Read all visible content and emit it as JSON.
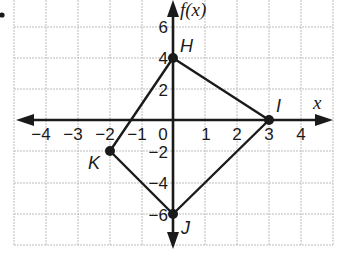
{
  "diagram": {
    "type": "coordinate-plane",
    "title": "",
    "x_axis_label": "x",
    "y_axis_label": "f(x)",
    "x_range": [
      -5,
      5
    ],
    "y_range": [
      -8,
      8
    ],
    "grid_x_step": 1,
    "grid_y_step": 2,
    "x_tick_labels": [
      "−4",
      "−3",
      "−2",
      "−1",
      "0",
      "1",
      "2",
      "3",
      "4"
    ],
    "y_tick_labels": [
      "6",
      "4",
      "2",
      "−2",
      "−4",
      "−6"
    ],
    "points": [
      {
        "label": "H",
        "x": 0,
        "y": 4
      },
      {
        "label": "I",
        "x": 3,
        "y": 0
      },
      {
        "label": "J",
        "x": 0,
        "y": -6
      },
      {
        "label": "K",
        "x": -2,
        "y": -2
      }
    ],
    "polygon": [
      "H",
      "I",
      "J",
      "K"
    ],
    "bullet": "•",
    "colors": {
      "grid": "#bdbdbd",
      "axis": "#1a1a1a",
      "shape": "#1a1a1a",
      "background": "#ffffff"
    }
  }
}
